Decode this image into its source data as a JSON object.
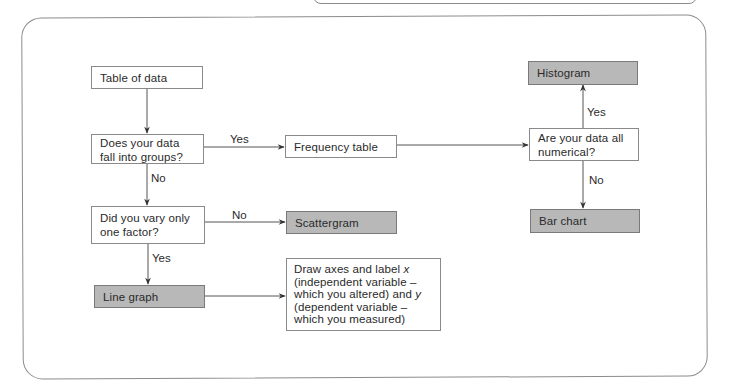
{
  "diagram": {
    "type": "flowchart",
    "nodes": {
      "table_of_data": "Table of data",
      "q_groups": "Does your data fall into groups?",
      "frequency_table": "Frequency table",
      "q_numerical": "Are your data all numerical?",
      "histogram": "Histogram",
      "bar_chart": "Bar chart",
      "q_one_factor": "Did you vary only one factor?",
      "scattergram": "Scattergram",
      "line_graph": "Line graph",
      "draw_axes_1": "Draw axes and label ",
      "draw_axes_x": "x",
      "draw_axes_2": " (independent variable – which you altered) and ",
      "draw_axes_y": "y",
      "draw_axes_3": " (dependent variable – which you measured)"
    },
    "edge_labels": {
      "groups_yes": "Yes",
      "groups_no": "No",
      "numerical_yes": "Yes",
      "numerical_no": "No",
      "factor_no": "No",
      "factor_yes": "Yes"
    },
    "edges": [
      {
        "from": "Table of data",
        "to": "Does your data fall into groups?",
        "label": ""
      },
      {
        "from": "Does your data fall into groups?",
        "to": "Frequency table",
        "label": "Yes"
      },
      {
        "from": "Does your data fall into groups?",
        "to": "Did you vary only one factor?",
        "label": "No"
      },
      {
        "from": "Frequency table",
        "to": "Are your data all numerical?",
        "label": ""
      },
      {
        "from": "Are your data all numerical?",
        "to": "Histogram",
        "label": "Yes"
      },
      {
        "from": "Are your data all numerical?",
        "to": "Bar chart",
        "label": "No"
      },
      {
        "from": "Did you vary only one factor?",
        "to": "Scattergram",
        "label": "No"
      },
      {
        "from": "Did you vary only one factor?",
        "to": "Line graph",
        "label": "Yes"
      },
      {
        "from": "Line graph",
        "to": "Draw axes and label x (independent variable – which you altered) and y (dependent variable – which you measured)",
        "label": ""
      }
    ],
    "colors": {
      "result_fill": "#b8b8b8",
      "node_fill": "#ffffff",
      "border": "#8a8a8a",
      "line": "#555555"
    }
  }
}
